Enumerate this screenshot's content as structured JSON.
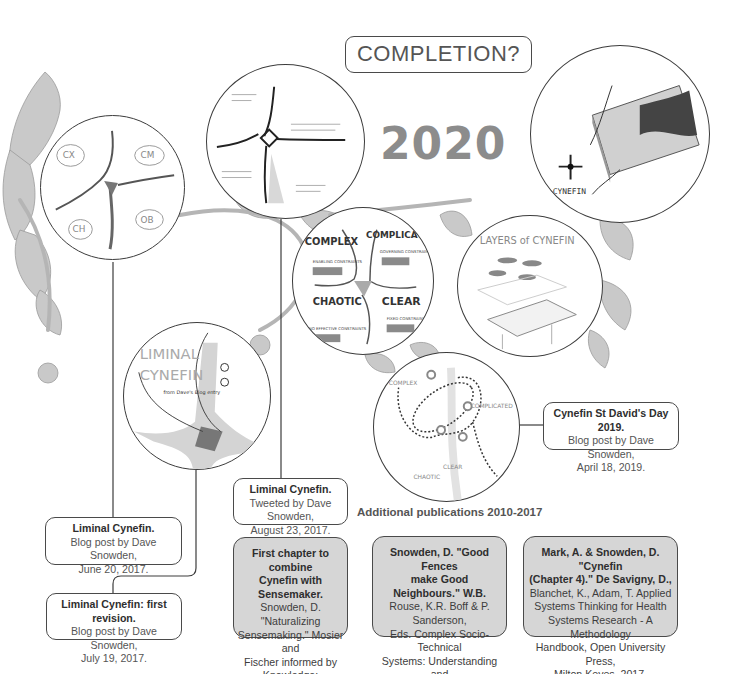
{
  "header": {
    "completion_label": "COMPLETION?",
    "year_label": "2020"
  },
  "illustrations": [
    {
      "id": "cynefin-early-sketch",
      "labels": [
        "CX",
        "CM",
        "CH",
        "OB"
      ]
    },
    {
      "id": "cynefin-hand-sketch",
      "labels": []
    },
    {
      "id": "cynefin-domains",
      "labels": [
        "COMPLEX",
        "COMPLICATED",
        "CHAOTIC",
        "CLEAR",
        "ENABLING CONSTRAINTS",
        "GOVERNING CONSTRAINTS",
        "NO EFFECTIVE CONSTRAINTS",
        "FIXED CONSTRAINTS",
        "A",
        "C"
      ]
    },
    {
      "id": "layers-of-cynefin",
      "labels": [
        "LAYERS of CYNEFIN"
      ]
    },
    {
      "id": "cynefin-3d-model",
      "labels": [
        "CYNEFIN",
        "COMPLICATED",
        "CLEAR",
        "COMPLEX",
        "CHAOTIC"
      ]
    },
    {
      "id": "liminal-cynefin-sketch",
      "labels": [
        "LIMINAL",
        "CYNEFIN",
        "from Dave's Blog entry"
      ]
    },
    {
      "id": "cynefin-dynamics",
      "labels": [
        "COMPLEX",
        "COMPLICATED",
        "CHAOTIC",
        "CLEAR"
      ]
    }
  ],
  "timeline": {
    "liminal_blog": {
      "title": "Liminal Cynefin.",
      "line1": "Blog post by Dave Snowden,",
      "line2": "June 20, 2017."
    },
    "liminal_revision": {
      "title": "Liminal Cynefin: first revision.",
      "line1": "Blog post by Dave Snowden,",
      "line2": "July 19, 2017."
    },
    "liminal_tweet": {
      "title": "Liminal Cynefin.",
      "line1": "Tweeted by Dave Snowden,",
      "line2": "August 23, 2017."
    },
    "st_davids": {
      "title": "Cynefin St David's Day 2019.",
      "line1": "Blog post by Dave Snowden,",
      "line2": "April 18, 2019."
    }
  },
  "additional": {
    "heading": "Additional publications 2010-2017",
    "items": [
      {
        "bold1": "First chapter to combine",
        "bold2": "Cynefin with Sensemaker.",
        "lines": [
          "Snowden, D. \"Naturalizing",
          "Sensemaking.\" Mosier and",
          "Fischer informed by Knowledge:",
          "Expert Performance in Complex",
          "Situation, 2010."
        ]
      },
      {
        "bold1": "Snowden, D. \"Good Fences",
        "bold2": "make Good Neighbours.\" W.B.",
        "lines": [
          "Rouse, K.R. Boff & P. Sanderson,",
          "Eds. Complex Socio-Technical",
          "Systems: Understanding and",
          "Influencing Casuality of Change,",
          "Amsterdam, IOS Press, 2012."
        ]
      },
      {
        "bold1": "Mark, A. & Snowden, D. \"Cynefin",
        "bold2": "(Chapter 4).\" De Savigny, D.,",
        "lines": [
          "Blanchet, K., Adam, T. Applied",
          "Systems Thinking for Health",
          "Systems Research - A Methodology",
          "Handbook, Open University Press,",
          "Milton Keyes, 2017."
        ]
      }
    ]
  },
  "colors": {
    "line": "#3c3c3c",
    "gray_box": "#d6d6d6",
    "year_text": "#8c8c8c",
    "foliage": "#a8a8a8"
  }
}
